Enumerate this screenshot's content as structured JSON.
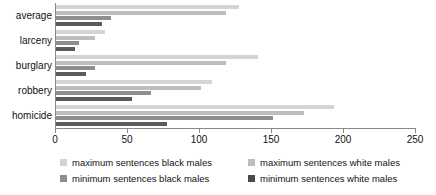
{
  "chart_data": {
    "type": "bar",
    "orientation": "horizontal",
    "title": "",
    "xlabel": "",
    "ylabel": "",
    "xlim": [
      0,
      250
    ],
    "grid": false,
    "legend_position": "bottom",
    "categories": [
      "homicide",
      "robbery",
      "burglary",
      "larceny",
      "average"
    ],
    "xticks": [
      0,
      50,
      100,
      150,
      200,
      250
    ],
    "series": [
      {
        "name": "maximum sentences black males",
        "color": "#d4d4d4",
        "values": [
          193,
          108,
          140,
          34,
          127
        ]
      },
      {
        "name": "maximum sentences white males",
        "color": "#bdbdbd",
        "values": [
          172,
          101,
          118,
          27,
          118
        ]
      },
      {
        "name": "minimum sentences black males",
        "color": "#8e8e8e",
        "values": [
          151,
          66,
          27,
          16,
          38
        ]
      },
      {
        "name": "minimum sentences white males",
        "color": "#4a4a4a",
        "values": [
          77,
          53,
          21,
          13,
          32
        ]
      }
    ]
  },
  "legend": {
    "items": [
      {
        "label": "maximum sentences black males",
        "swatch": "max-black-swatch"
      },
      {
        "label": "maximum sentences white males",
        "swatch": "max-white-swatch"
      },
      {
        "label": "minimum sentences black males",
        "swatch": "min-black-swatch"
      },
      {
        "label": "minimum sentences white males",
        "swatch": "min-white-swatch"
      }
    ]
  }
}
